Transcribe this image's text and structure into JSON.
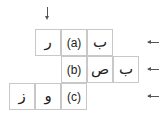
{
  "diagram": {
    "rows": [
      {
        "label": "(a)",
        "left_cells": [
          "ر"
        ],
        "right_cells": [
          "ب"
        ]
      },
      {
        "label": "(b)",
        "left_cells": [],
        "right_cells": [
          "ص",
          "ب"
        ]
      },
      {
        "label": "(c)",
        "left_cells": [
          "ز",
          "و"
        ],
        "right_cells": []
      }
    ],
    "arrows": {
      "top": "down-arrow",
      "right": [
        "left-arrow",
        "left-arrow",
        "left-arrow"
      ]
    },
    "colors": {
      "border": "#c8c8c8",
      "arrow": "#555555",
      "text": "#222222"
    }
  }
}
